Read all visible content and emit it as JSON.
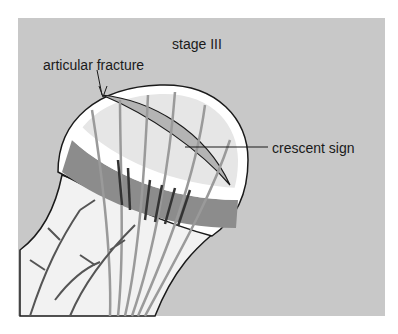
{
  "figure": {
    "title": "stage III",
    "labels": {
      "articular_fracture": "articular fracture",
      "crescent_sign": "crescent sign"
    },
    "colors": {
      "background": "#c8c8c8",
      "head_fill": "#e6e6e6",
      "neck_fill": "#f2f2f2",
      "cartilage": "#ffffff",
      "dark_band": "#8c8c8c",
      "crescent": "#b4b4b4",
      "vessels": "#555555",
      "trabeculae": "#9a9a9a",
      "outline": "#1a1a1a"
    }
  }
}
